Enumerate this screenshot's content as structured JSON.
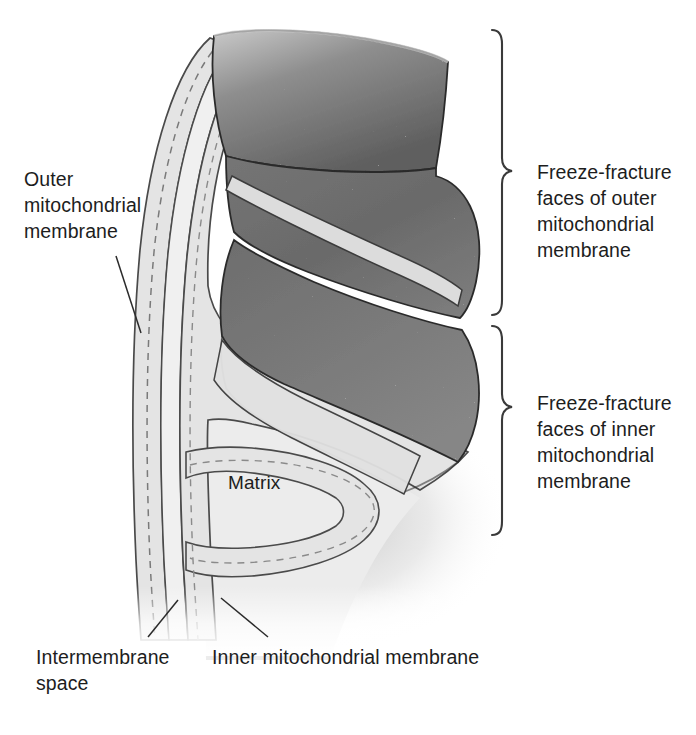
{
  "figure": {
    "background_color": "#ffffff",
    "ink_color": "#1d1d1d",
    "membrane_fill": "#e4e4e4",
    "matrix_fill": "#ececec",
    "fracture_face_dark": "#6e6e6e",
    "fracture_face_light": "#d8d8d8"
  },
  "labels": {
    "outer_membrane": "Outer\nmitochondrial\nmembrane",
    "freeze_fracture_outer": "Freeze-fracture\nfaces of outer\nmitochondrial\nmembrane",
    "freeze_fracture_inner": "Freeze-fracture\nfaces of inner\nmitochondrial\nmembrane",
    "matrix": "Matrix",
    "intermembrane_space": "Intermembrane\nspace",
    "inner_membrane": "Inner mitochondrial membrane"
  },
  "braces": [
    {
      "name": "outer-membrane-brace",
      "y_top": 28,
      "y_bottom": 316,
      "x": 500
    },
    {
      "name": "inner-membrane-brace",
      "y_top": 324,
      "y_bottom": 536,
      "x": 500
    }
  ],
  "leaders": [
    {
      "name": "outer-membrane-leader",
      "from": [
        118,
        258
      ],
      "to": [
        140,
        332
      ]
    },
    {
      "name": "intermembrane-space-leader",
      "from": [
        150,
        638
      ],
      "to": [
        178,
        600
      ]
    },
    {
      "name": "inner-membrane-leader",
      "from": [
        268,
        638
      ],
      "to": [
        222,
        598
      ]
    }
  ],
  "structures": [
    {
      "name": "outer-membrane-band",
      "kind": "bilayer-band"
    },
    {
      "name": "intermembrane-space-band",
      "kind": "space"
    },
    {
      "name": "inner-membrane-band",
      "kind": "bilayer-band"
    },
    {
      "name": "crista-fold",
      "kind": "infolding"
    },
    {
      "name": "matrix-region",
      "kind": "compartment"
    },
    {
      "name": "fracture-face-outer-upper",
      "kind": "speckled-face"
    },
    {
      "name": "fracture-face-outer-lower",
      "kind": "speckled-face"
    },
    {
      "name": "fracture-face-inner",
      "kind": "speckled-face"
    }
  ]
}
